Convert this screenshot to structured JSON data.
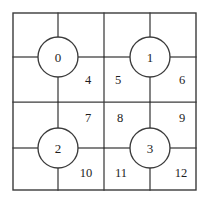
{
  "diagram": {
    "type": "quadtree-grid",
    "colors": {
      "stroke": "#3b3b3b",
      "text": "#1d1d1d",
      "background": "#ffffff"
    },
    "border": {
      "x": 13,
      "y": 13,
      "width": 183,
      "height": 177
    },
    "dividers": [
      {
        "name": "vertical-center-divider",
        "x1": 104,
        "y1": 13,
        "x2": 104,
        "y2": 190
      },
      {
        "name": "horizontal-center-divider",
        "x1": 13,
        "y1": 102,
        "x2": 196,
        "y2": 102
      }
    ],
    "nodes": [
      {
        "label": "0",
        "cx": 58,
        "cy": 57,
        "r": 20,
        "quadrant": "top-left"
      },
      {
        "label": "1",
        "cx": 150,
        "cy": 57,
        "r": 20,
        "quadrant": "top-right"
      },
      {
        "label": "2",
        "cx": 58,
        "cy": 148,
        "r": 20,
        "quadrant": "bottom-left"
      },
      {
        "label": "3",
        "cx": 150,
        "cy": 148,
        "r": 20,
        "quadrant": "bottom-right"
      }
    ],
    "spokes": [
      {
        "name": "node-0-spoke-up",
        "x1": 58,
        "y1": 37,
        "x2": 58,
        "y2": 13
      },
      {
        "name": "node-0-spoke-left",
        "x1": 38,
        "y1": 57,
        "x2": 13,
        "y2": 57
      },
      {
        "name": "node-0-spoke-right",
        "x1": 78,
        "y1": 57,
        "x2": 104,
        "y2": 57
      },
      {
        "name": "node-0-spoke-down",
        "x1": 58,
        "y1": 77,
        "x2": 58,
        "y2": 102
      },
      {
        "name": "node-1-spoke-up",
        "x1": 150,
        "y1": 37,
        "x2": 150,
        "y2": 13
      },
      {
        "name": "node-1-spoke-left",
        "x1": 130,
        "y1": 57,
        "x2": 104,
        "y2": 57
      },
      {
        "name": "node-1-spoke-right",
        "x1": 170,
        "y1": 57,
        "x2": 196,
        "y2": 57
      },
      {
        "name": "node-1-spoke-down",
        "x1": 150,
        "y1": 77,
        "x2": 150,
        "y2": 102
      },
      {
        "name": "node-2-spoke-up",
        "x1": 58,
        "y1": 128,
        "x2": 58,
        "y2": 102
      },
      {
        "name": "node-2-spoke-left",
        "x1": 38,
        "y1": 148,
        "x2": 13,
        "y2": 148
      },
      {
        "name": "node-2-spoke-right",
        "x1": 78,
        "y1": 148,
        "x2": 104,
        "y2": 148
      },
      {
        "name": "node-2-spoke-down",
        "x1": 58,
        "y1": 168,
        "x2": 58,
        "y2": 190
      },
      {
        "name": "node-3-spoke-up",
        "x1": 150,
        "y1": 128,
        "x2": 150,
        "y2": 102
      },
      {
        "name": "node-3-spoke-left",
        "x1": 130,
        "y1": 148,
        "x2": 104,
        "y2": 148
      },
      {
        "name": "node-3-spoke-right",
        "x1": 170,
        "y1": 148,
        "x2": 196,
        "y2": 148
      },
      {
        "name": "node-3-spoke-down",
        "x1": 150,
        "y1": 168,
        "x2": 150,
        "y2": 190
      }
    ],
    "regions": [
      {
        "label": "4",
        "x": 88,
        "y": 80,
        "quadrant": "top-left"
      },
      {
        "label": "5",
        "x": 118,
        "y": 80,
        "quadrant": "top-right"
      },
      {
        "label": "6",
        "x": 182,
        "y": 80,
        "quadrant": "top-right"
      },
      {
        "label": "7",
        "x": 88,
        "y": 118,
        "quadrant": "bottom-left"
      },
      {
        "label": "8",
        "x": 120,
        "y": 118,
        "quadrant": "bottom-right"
      },
      {
        "label": "9",
        "x": 182,
        "y": 118,
        "quadrant": "bottom-right"
      },
      {
        "label": "10",
        "x": 86,
        "y": 173,
        "quadrant": "bottom-left"
      },
      {
        "label": "11",
        "x": 121,
        "y": 173,
        "quadrant": "bottom-right"
      },
      {
        "label": "12",
        "x": 181,
        "y": 173,
        "quadrant": "bottom-right"
      }
    ]
  }
}
